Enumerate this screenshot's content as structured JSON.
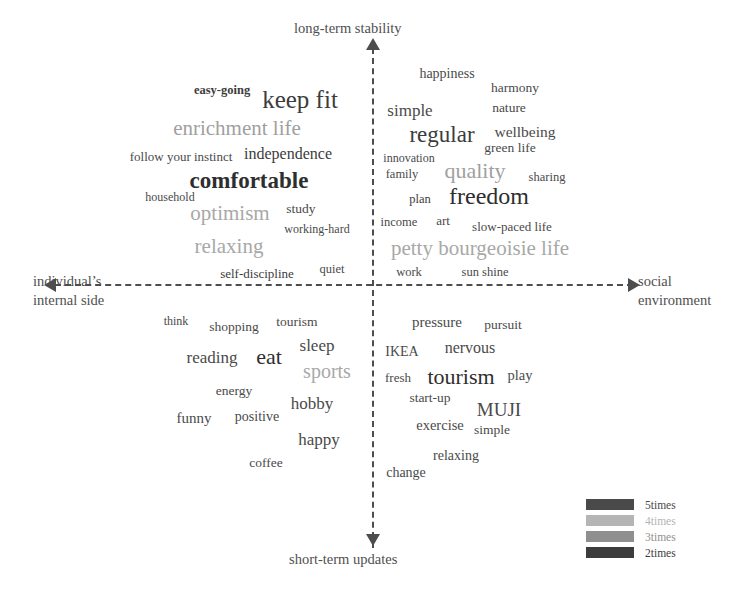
{
  "figure": {
    "type": "word-cloud-quadrant",
    "axes": {
      "top_label": "long-term stability",
      "bottom_label": "short-term updates",
      "left_label": "individual’s\ninternal side",
      "left_label_line1": "individual’s",
      "left_label_line2": "internal side",
      "right_label_line1": "social",
      "right_label_line2": "environment"
    },
    "legend": {
      "items": [
        {
          "label": "5times",
          "color": "#4a4a4a",
          "frequency": 5
        },
        {
          "label": "4times",
          "color": "#b5b5b5",
          "frequency": 4
        },
        {
          "label": "3times",
          "color": "#8f8f8f",
          "frequency": 3
        },
        {
          "label": "2times",
          "color": "#3c3c3c",
          "frequency": 2
        }
      ]
    }
  },
  "chart_data": {
    "type": "scatter",
    "title": "",
    "xlabel": "individual’s internal side ↔ social environment",
    "ylabel": "short-term updates ↔ long-term stability",
    "quadrants": [
      "upper-left: individual’s internal side / long-term stability",
      "upper-right: social environment / long-term stability",
      "lower-left: individual’s internal side / short-term updates",
      "lower-right: social environment / short-term updates"
    ],
    "words": [
      {
        "text": "easy-going",
        "x": 222,
        "y": 90,
        "size": 12.5,
        "color": "#3c3c3c",
        "weight": "bold",
        "quadrant": "upper-left"
      },
      {
        "text": "keep fit",
        "x": 300,
        "y": 99,
        "size": 25,
        "color": "#3c3c3c",
        "weight": "normal",
        "quadrant": "upper-left"
      },
      {
        "text": "enrichment life",
        "x": 237,
        "y": 128,
        "size": 21,
        "color": "#a0a0a0",
        "weight": "normal",
        "quadrant": "upper-left"
      },
      {
        "text": "follow your instinct",
        "x": 181,
        "y": 156,
        "size": 13,
        "color": "#4a4a4a",
        "weight": "normal",
        "quadrant": "upper-left"
      },
      {
        "text": "independence",
        "x": 288,
        "y": 154,
        "size": 16,
        "color": "#3c3c3c",
        "weight": "normal",
        "quadrant": "upper-left"
      },
      {
        "text": "comfortable",
        "x": 249,
        "y": 180,
        "size": 23,
        "color": "#2e2e2e",
        "weight": "bold",
        "quadrant": "upper-left"
      },
      {
        "text": "household",
        "x": 170,
        "y": 197,
        "size": 12,
        "color": "#4a4a4a",
        "weight": "normal",
        "quadrant": "upper-left"
      },
      {
        "text": "optimism",
        "x": 230,
        "y": 213,
        "size": 21,
        "color": "#a8a8a8",
        "weight": "normal",
        "quadrant": "upper-left"
      },
      {
        "text": "study",
        "x": 301,
        "y": 209,
        "size": 13.5,
        "color": "#4a4a4a",
        "weight": "normal",
        "quadrant": "upper-left"
      },
      {
        "text": "working-hard",
        "x": 317,
        "y": 229,
        "size": 12,
        "color": "#4a4a4a",
        "weight": "normal",
        "quadrant": "upper-left"
      },
      {
        "text": "relaxing",
        "x": 229,
        "y": 246,
        "size": 21,
        "color": "#a8a8a8",
        "weight": "normal",
        "quadrant": "upper-left"
      },
      {
        "text": "self-discipline",
        "x": 257,
        "y": 273,
        "size": 13,
        "color": "#3c3c3c",
        "weight": "normal",
        "quadrant": "upper-left"
      },
      {
        "text": "quiet",
        "x": 332,
        "y": 269,
        "size": 12.5,
        "color": "#4a4a4a",
        "weight": "normal",
        "quadrant": "upper-left"
      },
      {
        "text": "happiness",
        "x": 447,
        "y": 74,
        "size": 14,
        "color": "#4a4a4a",
        "weight": "normal",
        "quadrant": "upper-right"
      },
      {
        "text": "harmony",
        "x": 515,
        "y": 88,
        "size": 13.5,
        "color": "#4a4a4a",
        "weight": "normal",
        "quadrant": "upper-right"
      },
      {
        "text": "simple",
        "x": 410,
        "y": 110,
        "size": 17,
        "color": "#4a4a4a",
        "weight": "normal",
        "quadrant": "upper-right"
      },
      {
        "text": "nature",
        "x": 509,
        "y": 108,
        "size": 13.5,
        "color": "#4a4a4a",
        "weight": "normal",
        "quadrant": "upper-right"
      },
      {
        "text": "regular",
        "x": 442,
        "y": 134,
        "size": 23,
        "color": "#3c3c3c",
        "weight": "normal",
        "quadrant": "upper-right"
      },
      {
        "text": "wellbeing",
        "x": 525,
        "y": 132,
        "size": 15.5,
        "color": "#4a4a4a",
        "weight": "normal",
        "quadrant": "upper-right"
      },
      {
        "text": "green life",
        "x": 510,
        "y": 148,
        "size": 13.5,
        "color": "#4a4a4a",
        "weight": "normal",
        "quadrant": "upper-right"
      },
      {
        "text": "innovation",
        "x": 409,
        "y": 158,
        "size": 12,
        "color": "#4a4a4a",
        "weight": "normal",
        "quadrant": "upper-right"
      },
      {
        "text": "family",
        "x": 402,
        "y": 174,
        "size": 12.5,
        "color": "#4a4a4a",
        "weight": "normal",
        "quadrant": "upper-right"
      },
      {
        "text": "quality",
        "x": 475,
        "y": 171,
        "size": 22,
        "color": "#a0a0a0",
        "weight": "normal",
        "quadrant": "upper-right"
      },
      {
        "text": "sharing",
        "x": 547,
        "y": 177,
        "size": 12.5,
        "color": "#4a4a4a",
        "weight": "normal",
        "quadrant": "upper-right"
      },
      {
        "text": "plan",
        "x": 420,
        "y": 199,
        "size": 12.5,
        "color": "#3c3c3c",
        "weight": "normal",
        "quadrant": "upper-right"
      },
      {
        "text": "freedom",
        "x": 489,
        "y": 196,
        "size": 24,
        "color": "#2e2e2e",
        "weight": "normal",
        "quadrant": "upper-right"
      },
      {
        "text": "income",
        "x": 399,
        "y": 222,
        "size": 12.5,
        "color": "#4a4a4a",
        "weight": "normal",
        "quadrant": "upper-right"
      },
      {
        "text": "art",
        "x": 443,
        "y": 220,
        "size": 13,
        "color": "#4a4a4a",
        "weight": "normal",
        "quadrant": "upper-right"
      },
      {
        "text": "slow-paced life",
        "x": 512,
        "y": 226,
        "size": 13,
        "color": "#4a4a4a",
        "weight": "normal",
        "quadrant": "upper-right"
      },
      {
        "text": "petty bourgeoisie life",
        "x": 480,
        "y": 248,
        "size": 21,
        "color": "#a8a8a8",
        "weight": "normal",
        "quadrant": "upper-right"
      },
      {
        "text": "work",
        "x": 409,
        "y": 272,
        "size": 12.5,
        "color": "#4a4a4a",
        "weight": "normal",
        "quadrant": "upper-right"
      },
      {
        "text": "sun shine",
        "x": 485,
        "y": 272,
        "size": 12.5,
        "color": "#4a4a4a",
        "weight": "normal",
        "quadrant": "upper-right"
      },
      {
        "text": "think",
        "x": 176,
        "y": 321,
        "size": 12,
        "color": "#4a4a4a",
        "weight": "normal",
        "quadrant": "lower-left"
      },
      {
        "text": "shopping",
        "x": 234,
        "y": 327,
        "size": 13.5,
        "color": "#4a4a4a",
        "weight": "normal",
        "quadrant": "lower-left"
      },
      {
        "text": "tourism",
        "x": 297,
        "y": 322,
        "size": 13.5,
        "color": "#4a4a4a",
        "weight": "normal",
        "quadrant": "lower-left"
      },
      {
        "text": "sleep",
        "x": 317,
        "y": 345,
        "size": 17,
        "color": "#4a4a4a",
        "weight": "normal",
        "quadrant": "lower-left"
      },
      {
        "text": "reading",
        "x": 212,
        "y": 357,
        "size": 17,
        "color": "#4a4a4a",
        "weight": "normal",
        "quadrant": "lower-left"
      },
      {
        "text": "eat",
        "x": 269,
        "y": 357,
        "size": 22,
        "color": "#2e2e2e",
        "weight": "normal",
        "quadrant": "lower-left"
      },
      {
        "text": "sports",
        "x": 327,
        "y": 371,
        "size": 20,
        "color": "#a8a8a8",
        "weight": "normal",
        "quadrant": "lower-left"
      },
      {
        "text": "energy",
        "x": 234,
        "y": 391,
        "size": 13.5,
        "color": "#4a4a4a",
        "weight": "normal",
        "quadrant": "lower-left"
      },
      {
        "text": "hobby",
        "x": 312,
        "y": 403,
        "size": 17,
        "color": "#4a4a4a",
        "weight": "normal",
        "quadrant": "lower-left"
      },
      {
        "text": "funny",
        "x": 194,
        "y": 418,
        "size": 15,
        "color": "#4a4a4a",
        "weight": "normal",
        "quadrant": "lower-left"
      },
      {
        "text": "positive",
        "x": 257,
        "y": 417,
        "size": 14,
        "color": "#4a4a4a",
        "weight": "normal",
        "quadrant": "lower-left"
      },
      {
        "text": "happy",
        "x": 319,
        "y": 439,
        "size": 17,
        "color": "#4a4a4a",
        "weight": "normal",
        "quadrant": "lower-left"
      },
      {
        "text": "coffee",
        "x": 266,
        "y": 463,
        "size": 13.5,
        "color": "#4a4a4a",
        "weight": "normal",
        "quadrant": "lower-left"
      },
      {
        "text": "pressure",
        "x": 437,
        "y": 322,
        "size": 15,
        "color": "#4a4a4a",
        "weight": "normal",
        "quadrant": "lower-right"
      },
      {
        "text": "pursuit",
        "x": 503,
        "y": 325,
        "size": 13.5,
        "color": "#4a4a4a",
        "weight": "normal",
        "quadrant": "lower-right"
      },
      {
        "text": "IKEA",
        "x": 402,
        "y": 352,
        "size": 14,
        "color": "#4a4a4a",
        "weight": "normal",
        "quadrant": "lower-right"
      },
      {
        "text": "nervous",
        "x": 470,
        "y": 348,
        "size": 16,
        "color": "#4a4a4a",
        "weight": "normal",
        "quadrant": "lower-right"
      },
      {
        "text": "fresh",
        "x": 398,
        "y": 377,
        "size": 13,
        "color": "#4a4a4a",
        "weight": "normal",
        "quadrant": "lower-right"
      },
      {
        "text": "tourism",
        "x": 461,
        "y": 377,
        "size": 22,
        "color": "#2e2e2e",
        "weight": "normal",
        "quadrant": "lower-right"
      },
      {
        "text": "play",
        "x": 520,
        "y": 375,
        "size": 14.5,
        "color": "#4a4a4a",
        "weight": "normal",
        "quadrant": "lower-right"
      },
      {
        "text": "start-up",
        "x": 430,
        "y": 398,
        "size": 13.5,
        "color": "#4a4a4a",
        "weight": "normal",
        "quadrant": "lower-right"
      },
      {
        "text": "MUJI",
        "x": 499,
        "y": 409,
        "size": 19,
        "color": "#4a4a4a",
        "weight": "normal",
        "quadrant": "lower-right"
      },
      {
        "text": "exercise",
        "x": 440,
        "y": 425,
        "size": 14.5,
        "color": "#4a4a4a",
        "weight": "normal",
        "quadrant": "lower-right"
      },
      {
        "text": "simple",
        "x": 492,
        "y": 430,
        "size": 13.5,
        "color": "#4a4a4a",
        "weight": "normal",
        "quadrant": "lower-right"
      },
      {
        "text": "relaxing",
        "x": 456,
        "y": 456,
        "size": 14,
        "color": "#4a4a4a",
        "weight": "normal",
        "quadrant": "lower-right"
      },
      {
        "text": "change",
        "x": 406,
        "y": 473,
        "size": 14,
        "color": "#4a4a4a",
        "weight": "normal",
        "quadrant": "lower-right"
      }
    ]
  }
}
